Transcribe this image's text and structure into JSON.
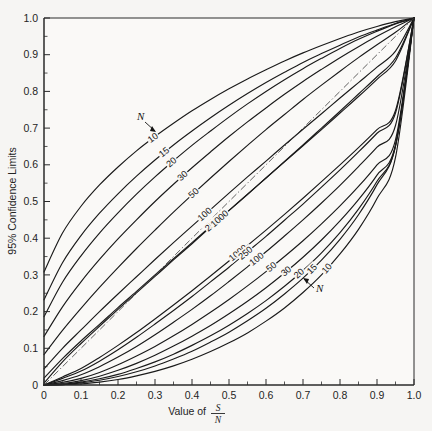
{
  "figure": {
    "background_color": "#f6f5f3",
    "line_color": "#1a1a1a",
    "reference_line_style": "dash-dot"
  },
  "annotations": {
    "upper_pointer_label": "N",
    "lower_pointer_label": "N"
  },
  "chart_data": {
    "type": "line",
    "title": "",
    "xlabel_prefix": "Value of",
    "xlabel_numerator": "S",
    "xlabel_denominator": "N",
    "ylabel": "95% Confidence Limits",
    "xlim": [
      0,
      1
    ],
    "ylim": [
      0,
      1
    ],
    "xticks": [
      0,
      0.1,
      0.2,
      0.3,
      0.4,
      0.5,
      0.6,
      0.7,
      0.8,
      0.9,
      1.0
    ],
    "xticklabels": [
      "0",
      "0.1",
      "0.2",
      "0.3",
      "0.4",
      "0.5",
      "0.6",
      "0.7",
      "0.8",
      "0.9",
      "1.0"
    ],
    "yticks": [
      0,
      0.1,
      0.2,
      0.3,
      0.4,
      0.5,
      0.6,
      0.7,
      0.8,
      0.9,
      1.0
    ],
    "yticklabels": [
      "0",
      "0.1",
      "0.2",
      "0.3",
      "0.4",
      "0.5",
      "0.6",
      "0.7",
      "0.8",
      "0.9",
      "1.0"
    ],
    "minor_ticks_per_interval": 1,
    "grid": false,
    "legend": "inline curve labels",
    "reference_line": {
      "name": "identity",
      "x": [
        0,
        1
      ],
      "y": [
        0,
        1
      ]
    },
    "sample_sizes": [
      10,
      15,
      20,
      30,
      50,
      100,
      250,
      1000
    ],
    "series": [
      {
        "name": "N=10 upper",
        "label": "10",
        "branch": "upper",
        "N": 10,
        "x": [
          0.0,
          0.05,
          0.1,
          0.15,
          0.2,
          0.25,
          0.3,
          0.35,
          0.4,
          0.45,
          0.5,
          0.55,
          0.6,
          0.65,
          0.7,
          0.75,
          0.8,
          0.85,
          0.9,
          0.95,
          1.0
        ],
        "y": [
          0.308,
          0.414,
          0.487,
          0.545,
          0.594,
          0.638,
          0.677,
          0.713,
          0.747,
          0.778,
          0.807,
          0.834,
          0.859,
          0.883,
          0.905,
          0.925,
          0.944,
          0.962,
          0.977,
          0.99,
          1.0
        ]
      },
      {
        "name": "N=15 upper",
        "label": "15",
        "branch": "upper",
        "N": 15,
        "x": [
          0.0,
          0.05,
          0.1,
          0.15,
          0.2,
          0.25,
          0.3,
          0.35,
          0.4,
          0.45,
          0.5,
          0.55,
          0.6,
          0.65,
          0.7,
          0.75,
          0.8,
          0.85,
          0.9,
          0.95,
          1.0
        ],
        "y": [
          0.232,
          0.333,
          0.407,
          0.468,
          0.521,
          0.569,
          0.613,
          0.654,
          0.692,
          0.728,
          0.762,
          0.794,
          0.824,
          0.852,
          0.879,
          0.903,
          0.926,
          0.948,
          0.967,
          0.985,
          1.0
        ]
      },
      {
        "name": "N=20 upper",
        "label": "20",
        "branch": "upper",
        "N": 20,
        "x": [
          0.0,
          0.05,
          0.1,
          0.15,
          0.2,
          0.25,
          0.3,
          0.35,
          0.4,
          0.45,
          0.5,
          0.55,
          0.6,
          0.65,
          0.7,
          0.75,
          0.8,
          0.85,
          0.9,
          0.95,
          1.0
        ],
        "y": [
          0.186,
          0.28,
          0.352,
          0.414,
          0.469,
          0.52,
          0.567,
          0.611,
          0.653,
          0.692,
          0.73,
          0.766,
          0.8,
          0.832,
          0.862,
          0.89,
          0.917,
          0.942,
          0.964,
          0.984,
          1.0
        ]
      },
      {
        "name": "N=30 upper",
        "label": "30",
        "branch": "upper",
        "N": 30,
        "x": [
          0.0,
          0.05,
          0.1,
          0.15,
          0.2,
          0.25,
          0.3,
          0.35,
          0.4,
          0.45,
          0.5,
          0.55,
          0.6,
          0.65,
          0.7,
          0.75,
          0.8,
          0.85,
          0.9,
          0.95,
          1.0
        ],
        "y": [
          0.132,
          0.213,
          0.281,
          0.342,
          0.398,
          0.45,
          0.5,
          0.547,
          0.592,
          0.635,
          0.677,
          0.717,
          0.755,
          0.792,
          0.827,
          0.86,
          0.892,
          0.922,
          0.95,
          0.976,
          1.0
        ]
      },
      {
        "name": "N=50 upper",
        "label": "50",
        "branch": "upper",
        "N": 50,
        "x": [
          0.0,
          0.05,
          0.1,
          0.15,
          0.2,
          0.25,
          0.3,
          0.35,
          0.4,
          0.45,
          0.5,
          0.55,
          0.6,
          0.65,
          0.7,
          0.75,
          0.8,
          0.85,
          0.9,
          0.95,
          1.0
        ],
        "y": [
          0.083,
          0.149,
          0.209,
          0.266,
          0.32,
          0.372,
          0.422,
          0.471,
          0.518,
          0.564,
          0.609,
          0.653,
          0.696,
          0.737,
          0.778,
          0.817,
          0.855,
          0.892,
          0.927,
          0.961,
          1.0
        ]
      },
      {
        "name": "N=100 upper",
        "label": "100",
        "branch": "upper",
        "N": 100,
        "x": [
          0.0,
          0.05,
          0.1,
          0.15,
          0.2,
          0.25,
          0.3,
          0.35,
          0.4,
          0.45,
          0.5,
          0.55,
          0.6,
          0.65,
          0.7,
          0.75,
          0.8,
          0.85,
          0.9,
          0.95,
          1.0
        ],
        "y": [
          0.044,
          0.1,
          0.15,
          0.2,
          0.248,
          0.295,
          0.342,
          0.388,
          0.433,
          0.478,
          0.523,
          0.567,
          0.61,
          0.654,
          0.697,
          0.739,
          0.782,
          0.824,
          0.866,
          0.91,
          1.0
        ]
      },
      {
        "name": "N=250 upper",
        "label": "250",
        "branch": "upper",
        "N": 250,
        "x": [
          0.0,
          0.05,
          0.1,
          0.15,
          0.2,
          0.25,
          0.3,
          0.35,
          0.4,
          0.45,
          0.5,
          0.55,
          0.6,
          0.65,
          0.7,
          0.75,
          0.8,
          0.85,
          0.9,
          0.95,
          1.0
        ],
        "y": [
          0.019,
          0.072,
          0.12,
          0.165,
          0.211,
          0.255,
          0.3,
          0.344,
          0.388,
          0.432,
          0.476,
          0.52,
          0.564,
          0.608,
          0.652,
          0.696,
          0.741,
          0.786,
          0.833,
          0.883,
          1.0
        ]
      },
      {
        "name": "N=1000 upper",
        "label": "1000",
        "branch": "upper",
        "N": 1000,
        "x": [
          0.0,
          0.05,
          0.1,
          0.15,
          0.2,
          0.25,
          0.3,
          0.35,
          0.4,
          0.45,
          0.5,
          0.55,
          0.6,
          0.65,
          0.7,
          0.75,
          0.8,
          0.85,
          0.9,
          0.95,
          1.0
        ],
        "y": [
          0.005,
          0.063,
          0.113,
          0.16,
          0.206,
          0.251,
          0.296,
          0.341,
          0.385,
          0.43,
          0.475,
          0.519,
          0.564,
          0.609,
          0.654,
          0.7,
          0.746,
          0.793,
          0.84,
          0.891,
          1.0
        ]
      },
      {
        "name": "N=1000 lower",
        "label": "1000",
        "branch": "lower",
        "N": 1000,
        "x": [
          0.0,
          0.05,
          0.1,
          0.15,
          0.2,
          0.25,
          0.3,
          0.35,
          0.4,
          0.45,
          0.5,
          0.55,
          0.6,
          0.65,
          0.7,
          0.75,
          0.8,
          0.85,
          0.9,
          0.95,
          1.0
        ],
        "y": [
          0.0,
          0.022,
          0.045,
          0.075,
          0.108,
          0.143,
          0.18,
          0.218,
          0.257,
          0.297,
          0.338,
          0.38,
          0.422,
          0.465,
          0.509,
          0.554,
          0.6,
          0.647,
          0.696,
          0.748,
          1.0
        ]
      },
      {
        "name": "N=250 lower",
        "label": "250",
        "branch": "lower",
        "N": 250,
        "x": [
          0.0,
          0.05,
          0.1,
          0.15,
          0.2,
          0.25,
          0.3,
          0.35,
          0.4,
          0.45,
          0.5,
          0.55,
          0.6,
          0.65,
          0.7,
          0.75,
          0.8,
          0.85,
          0.9,
          0.95,
          1.0
        ],
        "y": [
          0.0,
          0.018,
          0.038,
          0.065,
          0.096,
          0.13,
          0.166,
          0.203,
          0.241,
          0.281,
          0.321,
          0.363,
          0.405,
          0.449,
          0.493,
          0.539,
          0.586,
          0.635,
          0.686,
          0.741,
          1.0
        ]
      },
      {
        "name": "N=100 lower",
        "label": "100",
        "branch": "lower",
        "N": 100,
        "x": [
          0.0,
          0.05,
          0.1,
          0.15,
          0.2,
          0.25,
          0.3,
          0.35,
          0.4,
          0.45,
          0.5,
          0.55,
          0.6,
          0.65,
          0.7,
          0.75,
          0.8,
          0.85,
          0.9,
          0.95,
          1.0
        ],
        "y": [
          0.0,
          0.012,
          0.028,
          0.05,
          0.076,
          0.105,
          0.137,
          0.171,
          0.206,
          0.243,
          0.282,
          0.322,
          0.363,
          0.406,
          0.45,
          0.496,
          0.544,
          0.595,
          0.648,
          0.707,
          1.0
        ]
      },
      {
        "name": "N=50 lower",
        "label": "50",
        "branch": "lower",
        "N": 50,
        "x": [
          0.0,
          0.05,
          0.1,
          0.15,
          0.2,
          0.25,
          0.3,
          0.35,
          0.4,
          0.45,
          0.5,
          0.55,
          0.6,
          0.65,
          0.7,
          0.75,
          0.8,
          0.85,
          0.9,
          0.95,
          1.0
        ],
        "y": [
          0.0,
          0.007,
          0.018,
          0.034,
          0.055,
          0.079,
          0.105,
          0.134,
          0.165,
          0.198,
          0.233,
          0.27,
          0.309,
          0.35,
          0.393,
          0.439,
          0.488,
          0.541,
          0.6,
          0.668,
          1.0
        ]
      },
      {
        "name": "N=30 lower",
        "label": "30",
        "branch": "lower",
        "N": 30,
        "x": [
          0.0,
          0.05,
          0.1,
          0.15,
          0.2,
          0.25,
          0.3,
          0.35,
          0.4,
          0.45,
          0.5,
          0.55,
          0.6,
          0.65,
          0.7,
          0.75,
          0.8,
          0.85,
          0.9,
          0.95,
          1.0
        ],
        "y": [
          0.0,
          0.004,
          0.012,
          0.024,
          0.04,
          0.059,
          0.081,
          0.106,
          0.133,
          0.162,
          0.194,
          0.228,
          0.265,
          0.305,
          0.348,
          0.395,
          0.447,
          0.505,
          0.572,
          0.654,
          1.0
        ]
      },
      {
        "name": "N=20 lower",
        "label": "20",
        "branch": "lower",
        "N": 20,
        "x": [
          0.0,
          0.05,
          0.1,
          0.15,
          0.2,
          0.25,
          0.3,
          0.35,
          0.4,
          0.45,
          0.5,
          0.55,
          0.6,
          0.65,
          0.7,
          0.75,
          0.8,
          0.85,
          0.9,
          0.95,
          1.0
        ],
        "y": [
          0.0,
          0.002,
          0.008,
          0.017,
          0.029,
          0.045,
          0.063,
          0.084,
          0.108,
          0.134,
          0.163,
          0.195,
          0.23,
          0.269,
          0.312,
          0.36,
          0.415,
          0.479,
          0.555,
          0.651,
          1.0
        ]
      },
      {
        "name": "N=15 lower",
        "label": "15",
        "branch": "lower",
        "N": 15,
        "x": [
          0.0,
          0.05,
          0.1,
          0.15,
          0.2,
          0.25,
          0.3,
          0.35,
          0.4,
          0.45,
          0.5,
          0.55,
          0.6,
          0.65,
          0.7,
          0.75,
          0.8,
          0.85,
          0.9,
          0.95,
          1.0
        ],
        "y": [
          0.0,
          0.001,
          0.006,
          0.013,
          0.023,
          0.036,
          0.052,
          0.071,
          0.092,
          0.117,
          0.144,
          0.175,
          0.209,
          0.248,
          0.291,
          0.34,
          0.397,
          0.464,
          0.546,
          0.651,
          1.0
        ]
      },
      {
        "name": "N=10 lower",
        "label": "10",
        "branch": "lower",
        "N": 10,
        "x": [
          0.0,
          0.05,
          0.1,
          0.15,
          0.2,
          0.25,
          0.3,
          0.35,
          0.4,
          0.45,
          0.5,
          0.55,
          0.6,
          0.65,
          0.7,
          0.75,
          0.8,
          0.85,
          0.9,
          0.95,
          1.0
        ],
        "y": [
          0.0,
          0.001,
          0.003,
          0.008,
          0.015,
          0.025,
          0.037,
          0.052,
          0.07,
          0.091,
          0.115,
          0.142,
          0.174,
          0.21,
          0.252,
          0.3,
          0.357,
          0.424,
          0.508,
          0.62,
          1.0
        ]
      }
    ],
    "curve_labels_upper": [
      "10",
      "15",
      "20",
      "30",
      "50",
      "100",
      "250",
      "1000"
    ],
    "curve_labels_lower": [
      "1000",
      "250",
      "100",
      "50",
      "30",
      "20",
      "15",
      "10"
    ]
  }
}
